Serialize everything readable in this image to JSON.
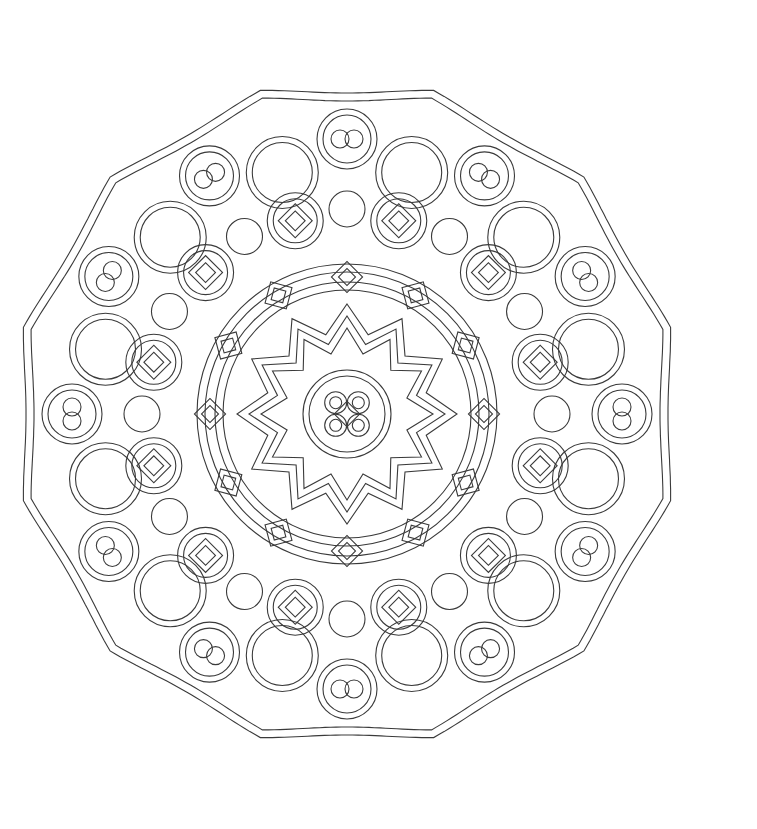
{
  "image": {
    "kind": "celtic-knot-mandala-coloring-page",
    "background": "#ffffff",
    "line_color": "#3a3a3a",
    "center": [
      347,
      414
    ],
    "outer_radius": 335,
    "petals": 12,
    "rings": [
      {
        "name": "center-knot",
        "radius": 42
      },
      {
        "name": "star-ring",
        "radius": 90,
        "points": 12
      },
      {
        "name": "inner-chain-ring",
        "radius": 140,
        "knots": 12
      },
      {
        "name": "middle-knot-ring",
        "radius": 200,
        "knots": 12
      },
      {
        "name": "outer-loop-ring",
        "radius": 268,
        "knots": 12
      }
    ]
  }
}
